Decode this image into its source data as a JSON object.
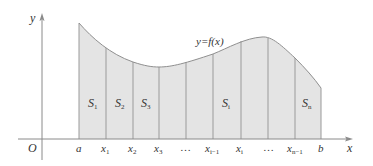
{
  "figure": {
    "curve_label": "y=f(x)",
    "axes": {
      "x_label": "x",
      "y_label": "y",
      "origin_label": "O"
    },
    "colors": {
      "fill": "#e4e4e4",
      "stroke": "#9a9a9a",
      "axis": "#8a8a8a",
      "text": "#333333"
    },
    "x_ticks": [
      {
        "base": "a",
        "sub": ""
      },
      {
        "base": "x",
        "sub": "1"
      },
      {
        "base": "x",
        "sub": "2"
      },
      {
        "base": "x",
        "sub": "3"
      },
      {
        "base": "…",
        "sub": ""
      },
      {
        "base": "x",
        "sub": "i−1"
      },
      {
        "base": "x",
        "sub": "i"
      },
      {
        "base": "…",
        "sub": ""
      },
      {
        "base": "x",
        "sub": "n−1"
      },
      {
        "base": "b",
        "sub": ""
      }
    ],
    "strip_labels": [
      {
        "base": "S",
        "sub": "1"
      },
      {
        "base": "S",
        "sub": "2"
      },
      {
        "base": "S",
        "sub": "3"
      },
      {
        "base": "S",
        "sub": "i"
      },
      {
        "base": "S",
        "sub": "n"
      }
    ]
  }
}
